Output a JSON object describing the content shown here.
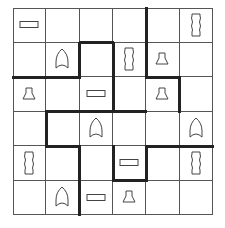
{
  "puzzle": {
    "rows": 6,
    "cols": 6,
    "line_color": "#555555",
    "thick_color": "#222222",
    "cells": [
      [
        "bar",
        "",
        "",
        "",
        "",
        "scroll"
      ],
      [
        "",
        "arch",
        "",
        "scroll",
        "bell",
        ""
      ],
      [
        "bell",
        "",
        "bar",
        "",
        "bell",
        ""
      ],
      [
        "",
        "",
        "arch",
        "",
        "",
        "arch"
      ],
      [
        "scroll",
        "",
        "",
        "bar",
        "",
        "scroll"
      ],
      [
        "",
        "arch",
        "bar",
        "bell",
        "",
        ""
      ]
    ],
    "thick_vertical": [
      {
        "x": 4,
        "row": 0
      },
      {
        "x": 2,
        "row": 1
      },
      {
        "x": 3,
        "row": 1
      },
      {
        "x": 4,
        "row": 1
      },
      {
        "x": 3,
        "row": 2
      },
      {
        "x": 5,
        "row": 2
      },
      {
        "x": 1,
        "row": 3
      },
      {
        "x": 2,
        "row": 4
      },
      {
        "x": 3,
        "row": 4
      },
      {
        "x": 4,
        "row": 4
      },
      {
        "x": 2,
        "row": 5
      }
    ],
    "thick_horizontal": [
      {
        "y": 1,
        "col": 2
      },
      {
        "y": 2,
        "col": 0
      },
      {
        "y": 2,
        "col": 1
      },
      {
        "y": 2,
        "col": 4
      },
      {
        "y": 3,
        "col": 1
      },
      {
        "y": 3,
        "col": 2
      },
      {
        "y": 3,
        "col": 3
      },
      {
        "y": 4,
        "col": 1
      },
      {
        "y": 4,
        "col": 4
      },
      {
        "y": 4,
        "col": 5
      },
      {
        "y": 5,
        "col": 3
      }
    ],
    "icons": {
      "bar": "bar-icon",
      "scroll": "scroll-icon",
      "arch": "arch-icon",
      "bell": "bell-icon"
    }
  }
}
